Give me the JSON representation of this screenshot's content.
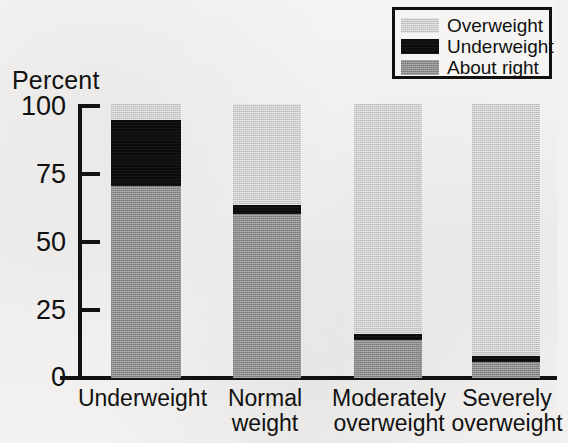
{
  "chart_data": {
    "type": "bar",
    "subtype": "stacked-100-percent",
    "title": "",
    "xlabel": "",
    "ylabel": "Percent",
    "ylim": [
      0,
      100
    ],
    "yticks": [
      0,
      25,
      50,
      75,
      100
    ],
    "grid": false,
    "legend_position": "top-right",
    "categories": [
      "Underweight",
      "Normal\nweight",
      "Moderately\noverweight",
      "Severely\noverweight"
    ],
    "series": [
      {
        "name": "Overweight",
        "color": "#c9c8c6",
        "values": [
          6,
          37,
          84,
          92
        ]
      },
      {
        "name": "Underweight",
        "color": "#0c0c0c",
        "values": [
          24,
          3,
          2,
          2
        ]
      },
      {
        "name": "About right",
        "color": "#8b8a88",
        "values": [
          70,
          60,
          14,
          6
        ]
      }
    ],
    "stack_order_top_to_bottom": [
      "Overweight",
      "Underweight",
      "About right"
    ]
  },
  "axes": {
    "y_title": "Percent",
    "y_tick_labels": [
      "100",
      "75",
      "50",
      "25",
      "0"
    ],
    "x_tick_labels": [
      "Underweight",
      "Normal\nweight",
      "Moderately\noverweight",
      "Severely\noverweight"
    ]
  },
  "legend": {
    "items": [
      {
        "label": "Overweight",
        "swatch": "overweight-swatch"
      },
      {
        "label": "Underweight",
        "swatch": "underweight-swatch"
      },
      {
        "label": "About right",
        "swatch": "about-right-swatch"
      }
    ]
  },
  "colors": {
    "overweight": "#c9c8c6",
    "underweight": "#0c0c0c",
    "about_right": "#8b8a88",
    "axis": "#111111",
    "background": "#f2f1ef"
  }
}
